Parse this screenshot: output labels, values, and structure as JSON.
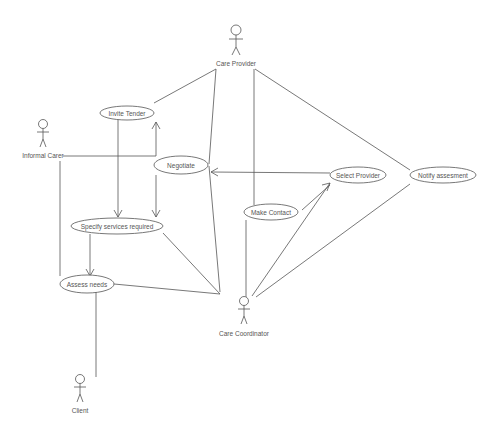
{
  "diagram": {
    "type": "uml-use-case",
    "actors": [
      {
        "id": "care_provider",
        "label": "Care Provider"
      },
      {
        "id": "informal_carer",
        "label": "Informal Carer"
      },
      {
        "id": "care_coordinator",
        "label": "Care Coordinator"
      },
      {
        "id": "client",
        "label": "Client"
      }
    ],
    "use_cases": [
      {
        "id": "invite_tender",
        "label": "Invite Tender"
      },
      {
        "id": "negotiate",
        "label": "Negotiate"
      },
      {
        "id": "specify_services",
        "label": "Specify services required"
      },
      {
        "id": "assess_needs",
        "label": "Assess needs"
      },
      {
        "id": "make_contact",
        "label": "Make Contact"
      },
      {
        "id": "select_provider",
        "label": "Select Provider"
      },
      {
        "id": "notify_assessment",
        "label": "Notify assesment"
      }
    ],
    "colors": {
      "stroke": "#555555",
      "text": "#555555",
      "background": "#ffffff"
    }
  }
}
